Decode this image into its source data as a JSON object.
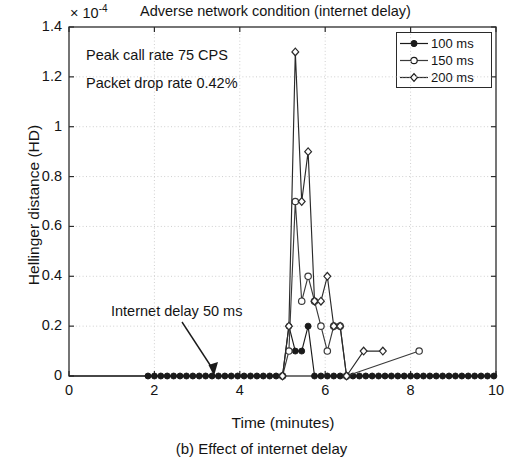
{
  "figure": {
    "caption": "(b) Effect of internet delay",
    "exponent_prefix": "× 10",
    "exponent_value": "-4",
    "title": "Adverse network condition (internet delay)"
  },
  "annotations": {
    "peak_call_rate": "Peak call rate 75 CPS",
    "packet_drop_rate": "Packet drop rate 0.42%",
    "internet_delay": "Internet delay 50 ms"
  },
  "legend": {
    "position": "top-right",
    "items": [
      {
        "label": "100 ms",
        "marker": "filled-circle",
        "color": "#1a1a1a"
      },
      {
        "label": "150 ms",
        "marker": "open-circle",
        "color": "#3a3a3a"
      },
      {
        "label": "200 ms",
        "marker": "open-diamond",
        "color": "#2a2a2a"
      }
    ]
  },
  "chart_data": {
    "type": "line",
    "title": "Adverse network condition (internet delay)",
    "subtitle": "(b) Effect of internet delay",
    "xlabel": "Time (minutes)",
    "ylabel": "Hellinger distance (HD)",
    "yscale_factor": "1e-4",
    "xlim": [
      0,
      10
    ],
    "ylim": [
      0,
      1.4
    ],
    "xticks": [
      0,
      2,
      4,
      6,
      8,
      10
    ],
    "yticks": [
      0,
      0.2,
      0.4,
      0.6,
      0.8,
      1,
      1.2,
      1.4
    ],
    "xticklabels": [
      "0",
      "2",
      "4",
      "6",
      "8",
      "10"
    ],
    "yticklabels": [
      "0",
      "0.2",
      "0.4",
      "0.6",
      "0.8",
      "1",
      "1.2",
      "1.4"
    ],
    "grid": true,
    "grid_style": "dotted",
    "legend_position": "upper right",
    "series": [
      {
        "name": "100 ms",
        "marker": "filled-circle",
        "x": [
          1.85,
          2.0,
          2.15,
          2.3,
          2.45,
          2.6,
          2.75,
          2.9,
          3.05,
          3.2,
          3.35,
          3.5,
          3.65,
          3.8,
          3.95,
          4.1,
          4.25,
          4.4,
          4.55,
          4.7,
          4.85,
          5.0,
          5.15,
          5.3,
          5.45,
          5.6,
          5.75,
          5.9,
          6.05,
          6.2,
          6.35,
          6.5,
          6.65,
          6.8,
          6.95,
          7.1,
          7.25,
          7.4,
          7.55,
          7.7,
          7.85,
          8.0,
          8.15,
          8.3,
          8.45,
          8.6,
          8.75,
          8.9,
          9.05,
          9.2,
          9.35,
          9.5,
          9.65,
          9.8,
          9.95
        ],
        "y": [
          0,
          0,
          0,
          0,
          0,
          0,
          0,
          0,
          0,
          0,
          0,
          0,
          0,
          0,
          0,
          0,
          0,
          0,
          0,
          0,
          0,
          0,
          0.2,
          0.1,
          0.1,
          0.2,
          0,
          0,
          0,
          0,
          0,
          0,
          0,
          0,
          0,
          0,
          0,
          0,
          0,
          0,
          0,
          0,
          0,
          0,
          0,
          0,
          0,
          0,
          0,
          0,
          0,
          0,
          0,
          0,
          0
        ]
      },
      {
        "name": "150 ms",
        "marker": "open-circle",
        "x": [
          5.0,
          5.15,
          5.3,
          5.45,
          5.6,
          5.75,
          5.9,
          6.05,
          6.2,
          6.35,
          6.5,
          8.2
        ],
        "y": [
          0,
          0.1,
          0.7,
          0.3,
          0.4,
          0.3,
          0.2,
          0.1,
          0.2,
          0.2,
          0,
          0.1
        ]
      },
      {
        "name": "200 ms",
        "marker": "open-diamond",
        "x": [
          5.0,
          5.15,
          5.3,
          5.45,
          5.6,
          5.75,
          5.9,
          6.05,
          6.2,
          6.35,
          6.5,
          6.9,
          7.35
        ],
        "y": [
          0,
          0.2,
          1.3,
          0.7,
          0.9,
          0.3,
          0.3,
          0.4,
          0.2,
          0.2,
          0,
          0.1,
          0.1
        ]
      }
    ],
    "notes": [
      "Peak call rate 75 CPS",
      "Packet drop rate 0.42%",
      "Internet delay 50 ms"
    ]
  },
  "axis_geometry": {
    "plot_left_px": 69,
    "plot_right_px": 496,
    "plot_top_px": 27,
    "plot_bottom_px": 376
  }
}
